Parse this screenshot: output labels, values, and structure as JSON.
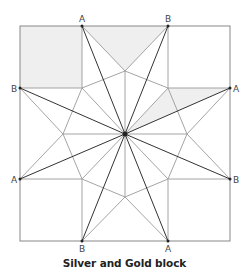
{
  "caption": "Silver and Gold block",
  "colors": {
    "outline": "#888888",
    "light_line": "#9a9a9a",
    "dark_line": "#333333",
    "shade": "#efefef",
    "label": "#444444"
  },
  "labels": {
    "top_left": "A",
    "top_right": "B",
    "right_top": "A",
    "right_bottom": "B",
    "bottom_right": "A",
    "bottom_left": "B",
    "left_bottom": "A",
    "left_top": "B"
  },
  "geometry": {
    "square": {
      "x": 20,
      "y": 26,
      "size": 210
    },
    "center": [
      125,
      134
    ],
    "corner_square_size": 62
  },
  "shaded_regions": [
    "top-left corner square",
    "top side triangle",
    "right-upper star point"
  ]
}
